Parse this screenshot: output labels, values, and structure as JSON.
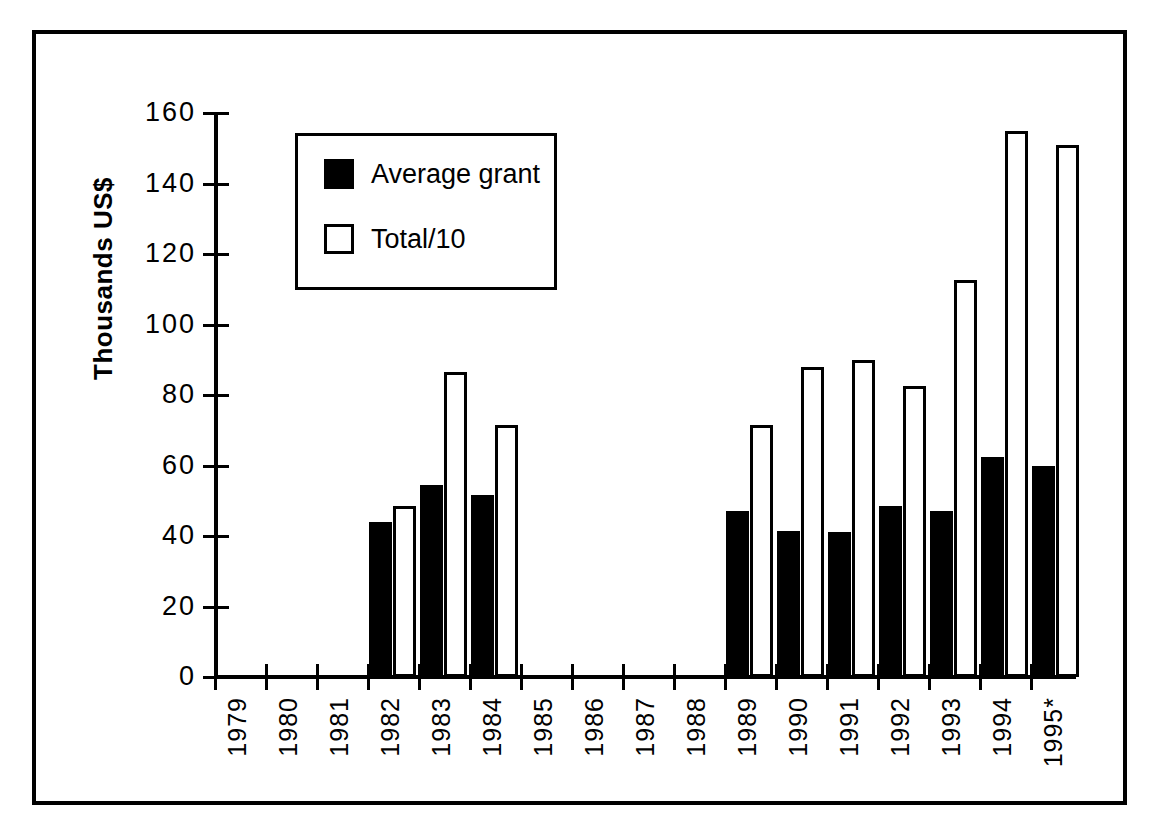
{
  "chart_data": {
    "type": "bar",
    "title": "",
    "subtitle": "",
    "xlabel": "",
    "ylabel": "Thousands US$",
    "ylim": [
      0,
      160
    ],
    "yticks": [
      0,
      20,
      40,
      60,
      80,
      100,
      120,
      140,
      160
    ],
    "ytick_labels": [
      "0",
      "20",
      "40",
      "60",
      "80",
      "100",
      "120",
      "140",
      "160"
    ],
    "grid": false,
    "legend_position": "upper-left-inside",
    "categories": [
      "1979",
      "1980",
      "1981",
      "1982",
      "1983",
      "1984",
      "1985",
      "1986",
      "1987",
      "1988",
      "1989",
      "1990",
      "1991",
      "1992",
      "1993",
      "1994",
      "1995*"
    ],
    "series": [
      {
        "name": "Average grant",
        "style": "solid-black",
        "values": [
          0,
          0,
          0,
          44,
          54.5,
          51.5,
          0,
          0,
          0,
          0,
          47,
          41.5,
          41,
          48.5,
          47,
          62.5,
          60
        ]
      },
      {
        "name": "Total/10",
        "style": "hollow-white",
        "values": [
          0,
          0,
          0,
          48.5,
          86.5,
          71.5,
          0,
          0,
          0,
          0,
          71.5,
          88,
          90,
          82.5,
          112.5,
          155,
          151
        ]
      }
    ],
    "annotations": [
      "Asterisk on 1995 indicates provisional / partial-year data"
    ]
  },
  "legend": {
    "items": [
      {
        "label": "Average grant",
        "swatch": "filled-black-square"
      },
      {
        "label": "Total/10",
        "swatch": "open-white-square"
      }
    ]
  },
  "colors": {
    "series_average_grant": "#000000",
    "series_total_div10_fill": "#ffffff",
    "series_total_div10_stroke": "#000000",
    "axis": "#000000",
    "background": "#ffffff",
    "frame": "#000000"
  }
}
